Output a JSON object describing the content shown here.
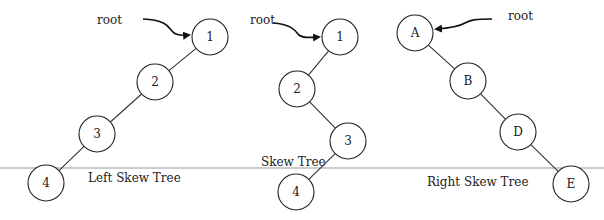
{
  "baseline": {
    "y": 168,
    "color": "#bbbbbb"
  },
  "trees": [
    {
      "name": "left-skew-tree",
      "caption": "Left Skew Tree",
      "caption_pos": [
        88,
        182
      ],
      "root_label": "root",
      "root_label_pos": [
        97,
        24
      ],
      "nodes": [
        {
          "label": "1",
          "x": 210,
          "y": 37
        },
        {
          "label": "2",
          "x": 155,
          "y": 82
        },
        {
          "label": "3",
          "x": 97,
          "y": 134
        },
        {
          "label": "4",
          "x": 46,
          "y": 183
        }
      ]
    },
    {
      "name": "skew-tree",
      "caption": "Skew Tree",
      "caption_pos": [
        261,
        166
      ],
      "root_label": "root",
      "root_label_pos": [
        250,
        24
      ],
      "nodes": [
        {
          "label": "1",
          "x": 340,
          "y": 37
        },
        {
          "label": "2",
          "x": 297,
          "y": 89
        },
        {
          "label": "3",
          "x": 348,
          "y": 141
        },
        {
          "label": "4",
          "x": 296,
          "y": 192
        }
      ]
    },
    {
      "name": "right-skew-tree",
      "caption": "Right Skew Tree",
      "caption_pos": [
        427,
        186
      ],
      "root_label": "root",
      "root_label_pos": [
        508,
        20
      ],
      "nodes": [
        {
          "label": "A",
          "x": 415,
          "y": 33
        },
        {
          "label": "B",
          "x": 468,
          "y": 81
        },
        {
          "label": "D",
          "x": 518,
          "y": 132
        },
        {
          "label": "E",
          "x": 571,
          "y": 184
        }
      ]
    }
  ],
  "node_radius": 18,
  "stroke_color": "#222222"
}
